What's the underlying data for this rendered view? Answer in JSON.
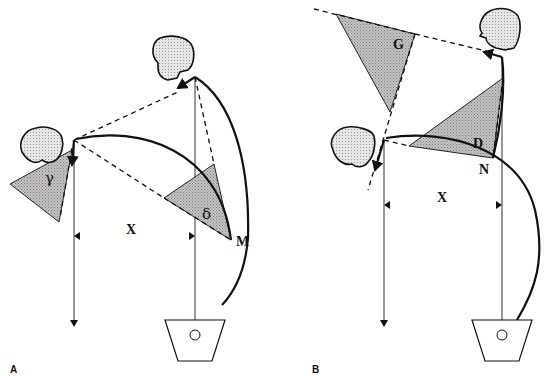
{
  "figure": {
    "panels": [
      {
        "id": "A",
        "label": "A",
        "distance_label": "X",
        "angle_labels": {
          "left": "γ",
          "right": "δ"
        },
        "point_label": "M"
      },
      {
        "id": "B",
        "label": "B",
        "distance_label": "X",
        "angle_labels": {
          "upper": "G",
          "right": "D"
        },
        "point_label": "N"
      }
    ]
  },
  "colors": {
    "line": "#111111",
    "shade": "#b8b8b8",
    "background": "#ffffff"
  }
}
